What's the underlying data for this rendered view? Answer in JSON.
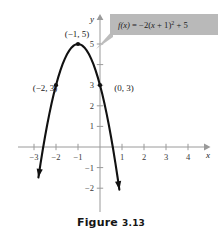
{
  "figure": {
    "caption_word": "Figure",
    "caption_number": "3.13"
  },
  "callout": {
    "equation_plain": "f(x) = -2(x + 1)^2 + 5",
    "fn_name": "f",
    "fn_arg": "(x)",
    "equals": " = ",
    "coefficient": "−2(",
    "inner": "x",
    "inner_rest": " + 1)",
    "exponent": "2",
    "tail": " + 5",
    "fill_color": "#b9b9b9",
    "text_color": "#1c1c1c",
    "leader_color": "#bdbdbd"
  },
  "axes": {
    "x_label": "x",
    "y_label": "y",
    "axis_color": "#9a9a9a",
    "x_ticks": [
      {
        "value": -3,
        "label": "−3"
      },
      {
        "value": -2,
        "label": "−2"
      },
      {
        "value": -1,
        "label": "−1"
      },
      {
        "value": 1,
        "label": "1"
      },
      {
        "value": 2,
        "label": "2"
      },
      {
        "value": 3,
        "label": "3"
      },
      {
        "value": 4,
        "label": "4"
      }
    ],
    "y_ticks": [
      {
        "value": 5,
        "label": "5"
      },
      {
        "value": 4,
        "label": ""
      },
      {
        "value": 3,
        "label": "3"
      },
      {
        "value": 2,
        "label": "2"
      },
      {
        "value": 1,
        "label": "1"
      },
      {
        "value": -1,
        "label": "−1"
      },
      {
        "value": -2,
        "label": "−2"
      }
    ]
  },
  "chart_data": {
    "type": "line",
    "title": "Figure 3.13",
    "xlabel": "x",
    "ylabel": "y",
    "xlim": [
      -3.6,
      4.9
    ],
    "ylim": [
      -2.9,
      6.2
    ],
    "grid": false,
    "legend": "none",
    "function": "f(x) = -2(x + 1)^2 + 5",
    "curve_color": "#111111",
    "vertex": {
      "x": -1,
      "y": 5
    },
    "annotations": [
      {
        "label": "(−1, 5)",
        "x": -1,
        "y": 5,
        "marker": true
      },
      {
        "label": "(−2, 3)",
        "x": -2,
        "y": 3,
        "marker": true
      },
      {
        "label": "(0, 3)",
        "x": 0,
        "y": 3,
        "marker": true
      }
    ],
    "x_ticks": [
      -3,
      -2,
      -1,
      1,
      2,
      3,
      4
    ],
    "y_ticks": [
      5,
      4,
      3,
      2,
      1,
      -1,
      -2
    ],
    "points": [
      {
        "x": -2.8,
        "y": -1.48
      },
      {
        "x": -2.7,
        "y": -0.78
      },
      {
        "x": -2.6,
        "y": -0.12
      },
      {
        "x": -2.5,
        "y": 0.5
      },
      {
        "x": -2.4,
        "y": 1.08
      },
      {
        "x": -2.3,
        "y": 1.62
      },
      {
        "x": -2.2,
        "y": 2.12
      },
      {
        "x": -2.1,
        "y": 2.58
      },
      {
        "x": -2.0,
        "y": 3.0
      },
      {
        "x": -1.9,
        "y": 3.38
      },
      {
        "x": -1.8,
        "y": 3.72
      },
      {
        "x": -1.7,
        "y": 4.02
      },
      {
        "x": -1.6,
        "y": 4.28
      },
      {
        "x": -1.5,
        "y": 4.5
      },
      {
        "x": -1.4,
        "y": 4.68
      },
      {
        "x": -1.3,
        "y": 4.82
      },
      {
        "x": -1.2,
        "y": 4.92
      },
      {
        "x": -1.1,
        "y": 4.98
      },
      {
        "x": -1.0,
        "y": 5.0
      },
      {
        "x": -0.9,
        "y": 4.98
      },
      {
        "x": -0.8,
        "y": 4.92
      },
      {
        "x": -0.7,
        "y": 4.82
      },
      {
        "x": -0.6,
        "y": 4.68
      },
      {
        "x": -0.5,
        "y": 4.5
      },
      {
        "x": -0.4,
        "y": 4.28
      },
      {
        "x": -0.3,
        "y": 4.02
      },
      {
        "x": -0.2,
        "y": 3.72
      },
      {
        "x": -0.1,
        "y": 3.38
      },
      {
        "x": 0.0,
        "y": 3.0
      },
      {
        "x": 0.1,
        "y": 2.58
      },
      {
        "x": 0.2,
        "y": 2.12
      },
      {
        "x": 0.3,
        "y": 1.62
      },
      {
        "x": 0.4,
        "y": 1.08
      },
      {
        "x": 0.5,
        "y": 0.5
      },
      {
        "x": 0.6,
        "y": -0.12
      },
      {
        "x": 0.7,
        "y": -0.78
      },
      {
        "x": 0.8,
        "y": -1.48
      },
      {
        "x": 0.88,
        "y": -2.07
      }
    ]
  }
}
